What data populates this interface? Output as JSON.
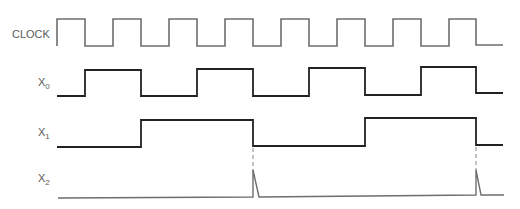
{
  "signals": [
    {
      "id": "clock",
      "label": "CLOCK",
      "sub": "",
      "color": "#6e6e6e",
      "width": 1.6,
      "high_y": 19,
      "low_y": 46,
      "points": [
        [
          57,
          46
        ],
        [
          57,
          19
        ],
        [
          85,
          19
        ],
        [
          85,
          46
        ],
        [
          113,
          46
        ],
        [
          113,
          19
        ],
        [
          141,
          19
        ],
        [
          141,
          46
        ],
        [
          169,
          46
        ],
        [
          169,
          19
        ],
        [
          197,
          19
        ],
        [
          197,
          46
        ],
        [
          225,
          46
        ],
        [
          225,
          19
        ],
        [
          253,
          19
        ],
        [
          253,
          46
        ],
        [
          281,
          46
        ],
        [
          281,
          19
        ],
        [
          309,
          19
        ],
        [
          309,
          46
        ],
        [
          337,
          46
        ],
        [
          337,
          19
        ],
        [
          365,
          19
        ],
        [
          365,
          46
        ],
        [
          393,
          46
        ],
        [
          393,
          19
        ],
        [
          421,
          19
        ],
        [
          421,
          46
        ],
        [
          449,
          46
        ],
        [
          449,
          19
        ],
        [
          476,
          19
        ],
        [
          476,
          45
        ],
        [
          503,
          45
        ]
      ]
    },
    {
      "id": "x0",
      "label": "X",
      "sub": "0",
      "color": "#222222",
      "width": 1.8,
      "points": [
        [
          57,
          96
        ],
        [
          85,
          96
        ],
        [
          85,
          70
        ],
        [
          141,
          70
        ],
        [
          141,
          96
        ],
        [
          197,
          96
        ],
        [
          197,
          69
        ],
        [
          253,
          69
        ],
        [
          253,
          96
        ],
        [
          309,
          96
        ],
        [
          309,
          68
        ],
        [
          365,
          68
        ],
        [
          365,
          95
        ],
        [
          421,
          95
        ],
        [
          421,
          67
        ],
        [
          476,
          67
        ],
        [
          476,
          93
        ],
        [
          503,
          93
        ]
      ]
    },
    {
      "id": "x1",
      "label": "X",
      "sub": "1",
      "color": "#222222",
      "width": 1.8,
      "points": [
        [
          57,
          147
        ],
        [
          141,
          147
        ],
        [
          141,
          120
        ],
        [
          253,
          120
        ],
        [
          253,
          146
        ],
        [
          365,
          146
        ],
        [
          365,
          118
        ],
        [
          476,
          118
        ],
        [
          476,
          145
        ],
        [
          503,
          145
        ]
      ]
    },
    {
      "id": "x2",
      "label": "X",
      "sub": "2",
      "color": "#6e6e6e",
      "width": 1.4,
      "points": [
        [
          58,
          198
        ],
        [
          253,
          197
        ],
        [
          253,
          170
        ],
        [
          259,
          197
        ],
        [
          476,
          195
        ],
        [
          476,
          170
        ],
        [
          481,
          195
        ],
        [
          504,
          195
        ]
      ]
    }
  ],
  "dashed_markers": [
    {
      "x": 253,
      "y1": 148,
      "y2": 172
    },
    {
      "x": 476,
      "y1": 147,
      "y2": 171
    }
  ]
}
